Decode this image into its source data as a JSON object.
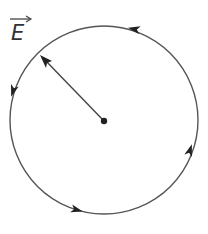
{
  "diagram": {
    "label": {
      "text": "E",
      "vector": true,
      "x": 11,
      "y": 40
    },
    "circle": {
      "cx": 104,
      "cy": 120,
      "r": 94,
      "stroke": "#555555",
      "direction": "counterclockwise"
    },
    "center_point": {
      "x": 104,
      "y": 121,
      "r": 3.2,
      "fill": "#222222"
    },
    "radius_arrow": {
      "from": [
        104,
        121
      ],
      "to": [
        40,
        55
      ],
      "stroke": "#444444"
    },
    "flow_arrows": [
      {
        "name": "top",
        "x": 134,
        "y": 28,
        "angle": 200
      },
      {
        "name": "left",
        "x": 12,
        "y": 92,
        "angle": 105
      },
      {
        "name": "bottom",
        "x": 76,
        "y": 211,
        "angle": 15
      },
      {
        "name": "right",
        "x": 190,
        "y": 152,
        "angle": -75
      }
    ]
  }
}
